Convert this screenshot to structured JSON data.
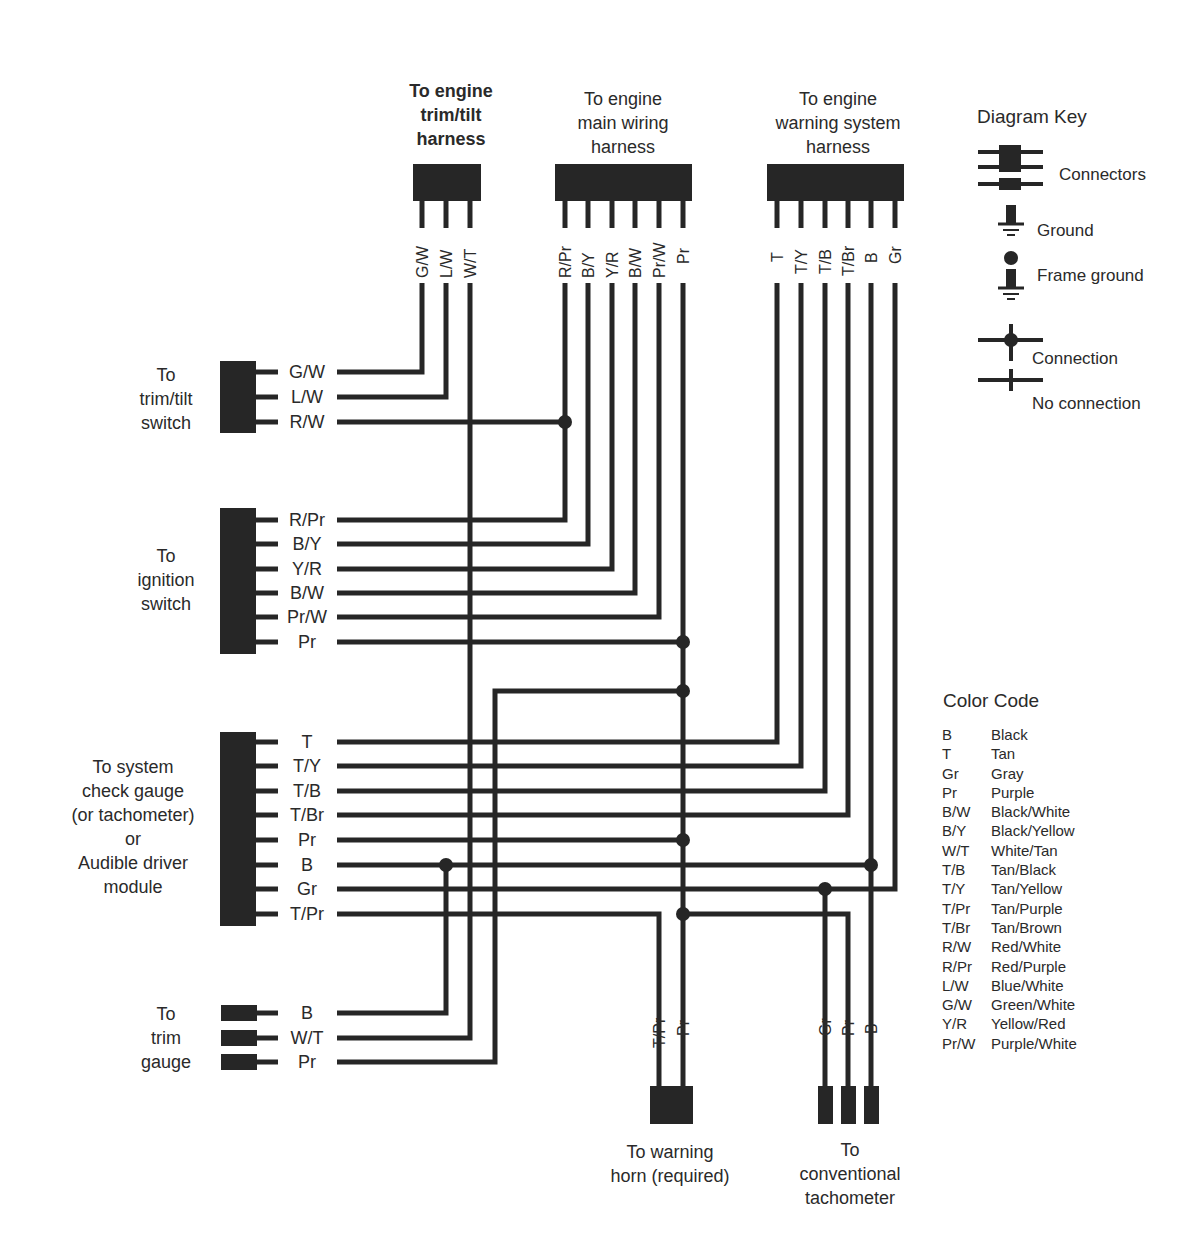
{
  "headers": {
    "trim_tilt_harness": "To engine\ntrim/tilt\nharness",
    "main_wiring_harness": "To engine\nmain wiring\nharness",
    "warning_system_harness": "To engine\nwarning system\nharness"
  },
  "harness_pins": {
    "trim_tilt": [
      "G/W",
      "L/W",
      "W/T"
    ],
    "main": [
      "R/Pr",
      "B/Y",
      "Y/R",
      "B/W",
      "Pr/W",
      "Pr"
    ],
    "warning": [
      "T",
      "T/Y",
      "T/B",
      "T/Br",
      "B",
      "Gr"
    ]
  },
  "left_components": {
    "trim_tilt_switch": {
      "label": "To\ntrim/tilt\nswitch",
      "pins": [
        "G/W",
        "L/W",
        "R/W"
      ]
    },
    "ignition_switch": {
      "label": "To\nignition\nswitch",
      "pins": [
        "R/Pr",
        "B/Y",
        "Y/R",
        "B/W",
        "Pr/W",
        "Pr"
      ]
    },
    "system_check_gauge": {
      "label": "To system\ncheck gauge\n(or tachometer)\nor\nAudible driver\nmodule",
      "pins": [
        "T",
        "T/Y",
        "T/B",
        "T/Br",
        "Pr",
        "B",
        "Gr",
        "T/Pr"
      ]
    },
    "trim_gauge": {
      "label": "To\ntrim\ngauge",
      "pins": [
        "B",
        "W/T",
        "Pr"
      ]
    }
  },
  "bottom_components": {
    "warning_horn": {
      "label": "To warning\nhorn (required)",
      "pins": [
        "T/Pr",
        "Pr"
      ]
    },
    "conventional_tachometer": {
      "label": "To\nconventional\ntachometer",
      "pins": [
        "Gr",
        "Pr",
        "B"
      ]
    }
  },
  "diagram_key": {
    "title": "Diagram Key",
    "items": [
      {
        "symbol": "connectors-icon",
        "label": "Connectors"
      },
      {
        "symbol": "ground-icon",
        "label": "Ground"
      },
      {
        "symbol": "frame-ground-icon",
        "label": "Frame ground"
      },
      {
        "symbol": "connection-icon",
        "label": "Connection"
      },
      {
        "symbol": "no-connection-icon",
        "label": "No connection"
      }
    ]
  },
  "color_code": {
    "title": "Color Code",
    "entries": [
      {
        "code": "B",
        "name": "Black"
      },
      {
        "code": "T",
        "name": "Tan"
      },
      {
        "code": "Gr",
        "name": "Gray"
      },
      {
        "code": "Pr",
        "name": "Purple"
      },
      {
        "code": "B/W",
        "name": "Black/White"
      },
      {
        "code": "B/Y",
        "name": "Black/Yellow"
      },
      {
        "code": "W/T",
        "name": "White/Tan"
      },
      {
        "code": "T/B",
        "name": "Tan/Black"
      },
      {
        "code": "T/Y",
        "name": "Tan/Yellow"
      },
      {
        "code": "T/Pr",
        "name": "Tan/Purple"
      },
      {
        "code": "T/Br",
        "name": "Tan/Brown"
      },
      {
        "code": "R/W",
        "name": "Red/White"
      },
      {
        "code": "R/Pr",
        "name": "Red/Purple"
      },
      {
        "code": "L/W",
        "name": "Blue/White"
      },
      {
        "code": "G/W",
        "name": "Green/White"
      },
      {
        "code": "Y/R",
        "name": "Yellow/Red"
      },
      {
        "code": "Pr/W",
        "name": "Purple/White"
      }
    ]
  },
  "colors": {
    "wire": "#262626",
    "text": "#2a2a2a",
    "background": "#ffffff"
  }
}
